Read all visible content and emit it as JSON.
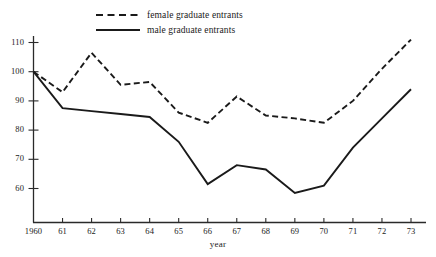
{
  "chart_data": {
    "type": "line",
    "title": "",
    "subtitle": "",
    "xlabel": "year",
    "ylabel": "",
    "x": [
      1960,
      1961,
      1962,
      1963,
      1964,
      1965,
      1966,
      1967,
      1968,
      1969,
      1970,
      1971,
      1972,
      1973
    ],
    "xtick_labels": [
      "1960",
      "61",
      "62",
      "63",
      "64",
      "65",
      "66",
      "67",
      "68",
      "69",
      "70",
      "71",
      "72",
      "73"
    ],
    "ytick_labels": [
      "110",
      "100",
      "90",
      "80",
      "70",
      "60"
    ],
    "ytick_values": [
      110,
      100,
      90,
      80,
      70,
      60
    ],
    "xlim": [
      1960,
      1973
    ],
    "ylim": [
      53,
      114
    ],
    "grid": false,
    "legend_position": "top-left",
    "series": [
      {
        "name": "female graduate entrants",
        "style": "dashed",
        "color": "#1a1a1a",
        "values": [
          100,
          93,
          106.5,
          95.5,
          96.5,
          86,
          82.5,
          91.5,
          85,
          84,
          82.5,
          90,
          101,
          111
        ]
      },
      {
        "name": "male graduate entrants",
        "style": "solid",
        "color": "#1a1a1a",
        "values": [
          100,
          87.5,
          86.5,
          85.5,
          84.5,
          76,
          61.5,
          68,
          66.5,
          58.5,
          61,
          74,
          84,
          94
        ]
      }
    ]
  },
  "legend": {
    "items": [
      {
        "label": "female graduate entrants",
        "style": "dashed"
      },
      {
        "label": "male graduate entrants",
        "style": "solid"
      }
    ]
  },
  "axes": {
    "x_title": "year"
  }
}
